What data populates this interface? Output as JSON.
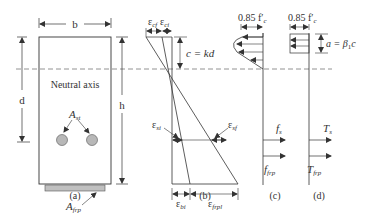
{
  "figure": {
    "panels": [
      {
        "id": "a",
        "caption": "(a)"
      },
      {
        "id": "b",
        "caption": "(b)"
      },
      {
        "id": "c",
        "caption": "(c)"
      },
      {
        "id": "d",
        "caption": "(d)"
      }
    ],
    "section": {
      "width_label": "b",
      "depth_label": "d",
      "height_label": "h",
      "neutral_axis_label": "Neutral axis",
      "steel_area_label": "A",
      "steel_area_sub": "st",
      "frp_area_label": "A",
      "frp_area_sub": "frp"
    },
    "strain": {
      "top_left_label": "ε",
      "top_left_sub": "cf",
      "top_right_label": "ε",
      "top_right_sub": "ci",
      "na_depth_label": "c = kd",
      "steel_left_label": "ε",
      "steel_left_sub": "si",
      "steel_right_label": "ε",
      "steel_right_sub": "sf",
      "bottom_left_label": "ε",
      "bottom_left_sub": "bi",
      "bottom_right_label": "ε",
      "bottom_right_sub": "frpl"
    },
    "stress": {
      "top_label": "0.85 f′",
      "top_sub": "c",
      "steel_label": "f",
      "steel_sub": "s",
      "frp_label": "f",
      "frp_sub": "frp"
    },
    "forces": {
      "top_label": "0.85 f′",
      "top_sub": "c",
      "block_depth_label": "a = β",
      "block_depth_sub": "1",
      "block_depth_tail": "c",
      "steel_label": "T",
      "steel_sub": "s",
      "frp_label": "T",
      "frp_sub": "frp"
    },
    "colors": {
      "line": "#333333",
      "rebar_fill": "#b8b8b8",
      "frp_fill": "#c0c0c0",
      "neutral_axis": "#666666"
    }
  }
}
